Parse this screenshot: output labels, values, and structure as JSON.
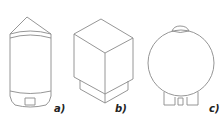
{
  "figure": {
    "panels": [
      {
        "id": "a",
        "label": "a)",
        "shape": "vertical-cylinder-tank"
      },
      {
        "id": "b",
        "label": "b)",
        "shape": "rectangular-box-tank"
      },
      {
        "id": "c",
        "label": "c)",
        "shape": "spherical-tank"
      }
    ],
    "colors": {
      "stroke": "#8a8a8a",
      "label": "#222222",
      "background": "#ffffff"
    }
  }
}
